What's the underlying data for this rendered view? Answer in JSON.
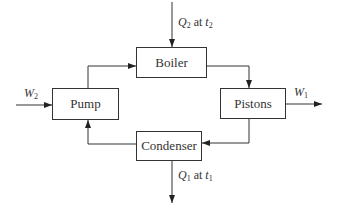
{
  "diagram": {
    "nodes": [
      {
        "id": "boiler",
        "label": "Boiler"
      },
      {
        "id": "pistons",
        "label": "Pistons"
      },
      {
        "id": "condenser",
        "label": "Condenser"
      },
      {
        "id": "pump",
        "label": "Pump"
      }
    ],
    "flows": {
      "heat_in": {
        "symbol": "Q",
        "sub": "2",
        "at": "at",
        "temp": "t",
        "temp_sub": "2"
      },
      "heat_out": {
        "symbol": "Q",
        "sub": "1",
        "at": "at",
        "temp": "t",
        "temp_sub": "1"
      },
      "work_in": {
        "symbol": "W",
        "sub": "2"
      },
      "work_out": {
        "symbol": "W",
        "sub": "1"
      }
    },
    "edges": [
      {
        "from": "pump",
        "to": "boiler"
      },
      {
        "from": "boiler",
        "to": "pistons"
      },
      {
        "from": "pistons",
        "to": "condenser"
      },
      {
        "from": "condenser",
        "to": "pump"
      }
    ]
  }
}
